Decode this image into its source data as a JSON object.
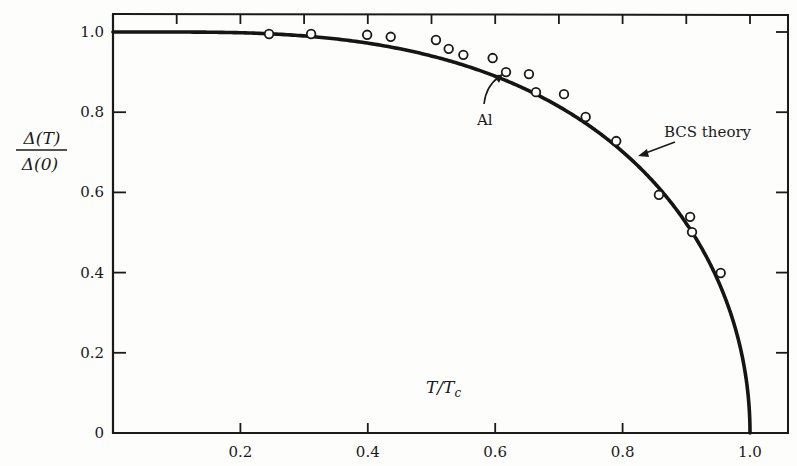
{
  "chart_data": {
    "type": "line",
    "title": "",
    "xlabel": "T/T_c",
    "ylabel": "Δ(T)/Δ(0)",
    "ylabel_num": "Δ(T)",
    "ylabel_den": "Δ(0)",
    "xlabel_main": "T/T",
    "xlabel_sub": "c",
    "xlim": [
      0,
      1.05
    ],
    "ylim": [
      0,
      1.05
    ],
    "grid": false,
    "legend": "none",
    "x_ticks": [
      {
        "value": 0.2,
        "label": "0.2"
      },
      {
        "value": 0.4,
        "label": "0.4"
      },
      {
        "value": 0.6,
        "label": "0.6"
      },
      {
        "value": 0.8,
        "label": "0.8"
      },
      {
        "value": 1.0,
        "label": "1.0"
      }
    ],
    "x_minor_ticks_top": [
      0.1,
      0.2,
      0.3,
      0.4,
      0.5,
      0.6,
      0.7,
      0.8,
      0.9,
      1.0
    ],
    "y_ticks": [
      {
        "value": 0,
        "label": "0"
      },
      {
        "value": 0.2,
        "label": "0.2"
      },
      {
        "value": 0.4,
        "label": "0.4"
      },
      {
        "value": 0.6,
        "label": "0.6"
      },
      {
        "value": 0.8,
        "label": "0.8"
      },
      {
        "value": 1.0,
        "label": "1.0"
      }
    ],
    "series": [
      {
        "name": "BCS theory",
        "kind": "curve",
        "model": "tanh(1.74*sqrt(1/t - 1))",
        "x": [
          0.0,
          0.1,
          0.2,
          0.3,
          0.4,
          0.5,
          0.6,
          0.7,
          0.8,
          0.9,
          0.95,
          0.99,
          1.0
        ],
        "values": [
          1.0,
          1.0,
          1.0,
          0.99,
          0.98,
          0.94,
          0.89,
          0.81,
          0.7,
          0.52,
          0.38,
          0.17,
          0.0
        ]
      },
      {
        "name": "Al",
        "kind": "points",
        "x": [
          0.245,
          0.311,
          0.399,
          0.436,
          0.507,
          0.527,
          0.55,
          0.596,
          0.617,
          0.653,
          0.664,
          0.708,
          0.742,
          0.79,
          0.857,
          0.906,
          0.909,
          0.954
        ],
        "values": [
          0.995,
          0.995,
          0.993,
          0.988,
          0.98,
          0.958,
          0.943,
          0.935,
          0.9,
          0.895,
          0.85,
          0.845,
          0.788,
          0.728,
          0.594,
          0.539,
          0.501,
          0.399
        ]
      }
    ],
    "annotations": [
      {
        "text": "Al",
        "points_to": [
          0.617,
          0.9
        ]
      },
      {
        "text": "BCS theory",
        "points_to": [
          0.805,
          0.7
        ]
      }
    ]
  }
}
